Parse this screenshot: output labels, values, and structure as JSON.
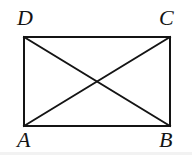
{
  "figure": {
    "kind": "rectangle-with-diagonals",
    "background_color": "#ffffff",
    "stroke_color": "#141414",
    "stroke_width": 2,
    "canvas": {
      "width": 192,
      "height": 155
    },
    "rectangle": {
      "top_left": {
        "x": 24,
        "y": 37
      },
      "top_right": {
        "x": 170,
        "y": 37
      },
      "bottom_right": {
        "x": 170,
        "y": 126
      },
      "bottom_left": {
        "x": 24,
        "y": 126
      }
    },
    "diagonals": [
      {
        "name": "diagonal-A-C",
        "from": {
          "x": 24,
          "y": 126
        },
        "to": {
          "x": 170,
          "y": 37
        }
      },
      {
        "name": "diagonal-D-B",
        "from": {
          "x": 24,
          "y": 37
        },
        "to": {
          "x": 170,
          "y": 126
        }
      }
    ],
    "intersection": {
      "x": 97,
      "y": 81.5
    },
    "labels": {
      "top_left": "D",
      "top_right": "C",
      "bottom_left": "A",
      "bottom_right": "B"
    }
  }
}
